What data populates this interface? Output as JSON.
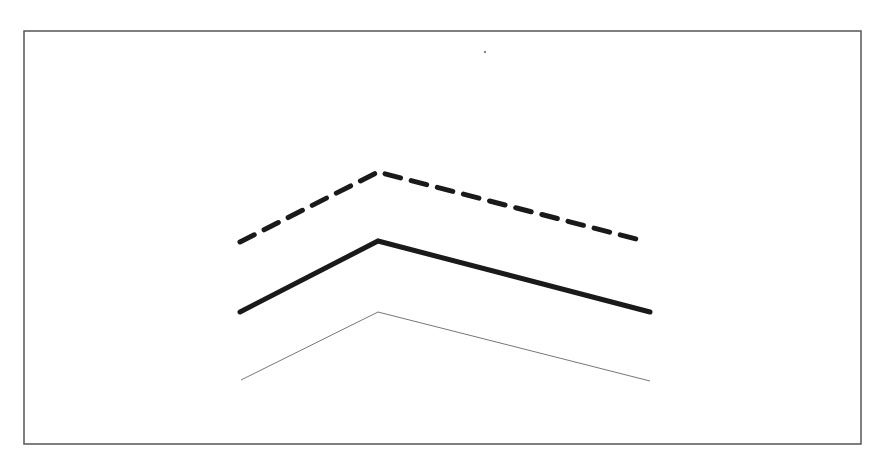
{
  "diagram": {
    "frame": {
      "x": 24,
      "y": 31,
      "width": 837,
      "height": 413,
      "stroke": "#555555",
      "stroke_width": 1.5
    },
    "stray_dot": {
      "x": 485,
      "y": 52,
      "r": 1.2,
      "color": "#888888"
    },
    "lines": [
      {
        "name": "dashed-thick-line",
        "style": "dashed",
        "color": "#1a1a1a",
        "width": 5,
        "dash": "16 11",
        "points": [
          [
            240,
            242
          ],
          [
            378,
            172
          ],
          [
            640,
            240
          ]
        ]
      },
      {
        "name": "solid-thick-line",
        "style": "solid",
        "color": "#1a1a1a",
        "width": 5,
        "dash": "",
        "points": [
          [
            240,
            312
          ],
          [
            378,
            241
          ],
          [
            650,
            312
          ]
        ]
      },
      {
        "name": "solid-thin-line",
        "style": "solid",
        "color": "#777777",
        "width": 1,
        "dash": "",
        "points": [
          [
            241,
            380
          ],
          [
            378,
            312
          ],
          [
            650,
            381
          ]
        ]
      }
    ]
  }
}
